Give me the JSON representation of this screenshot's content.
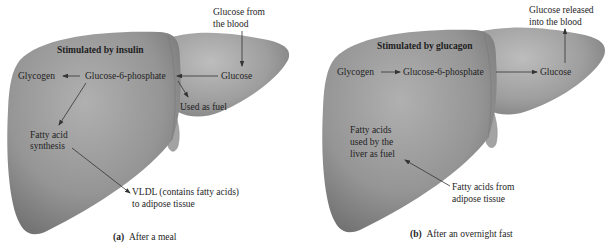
{
  "panels": [
    {
      "id": "a",
      "caption_letter": "(a)",
      "caption_text": "After a meal",
      "stimulus": "Stimulated by insulin",
      "labels": {
        "glycogen": "Glycogen",
        "g6p": "Glucose-6-phosphate",
        "glucose": "Glucose",
        "glucose_source_line1": "Glucose from",
        "glucose_source_line2": "the blood",
        "fuel": "Used as fuel",
        "fatty_line1": "Fatty acid",
        "fatty_line2": "synthesis",
        "vldl_line1": "VLDL (contains fatty acids)",
        "vldl_line2": "to adipose tissue"
      }
    },
    {
      "id": "b",
      "caption_letter": "(b)",
      "caption_text": "After an overnight fast",
      "stimulus": "Stimulated by glucagon",
      "labels": {
        "glycogen": "Glycogen",
        "g6p": "Glucose-6-phosphate",
        "glucose": "Glucose",
        "glucose_release_line1": "Glucose released",
        "glucose_release_line2": "into the blood",
        "fatty_line1": "Fatty acids",
        "fatty_line2": "used by the",
        "fatty_line3": "liver as fuel",
        "adipose_line1": "Fatty acids from",
        "adipose_line2": "adipose tissue"
      }
    }
  ],
  "colors": {
    "liver_light": "#a9a9a9",
    "liver_mid": "#8c8c8c",
    "liver_dark": "#6f6f6f",
    "text": "#1e1e1e",
    "arrow": "#333333"
  }
}
